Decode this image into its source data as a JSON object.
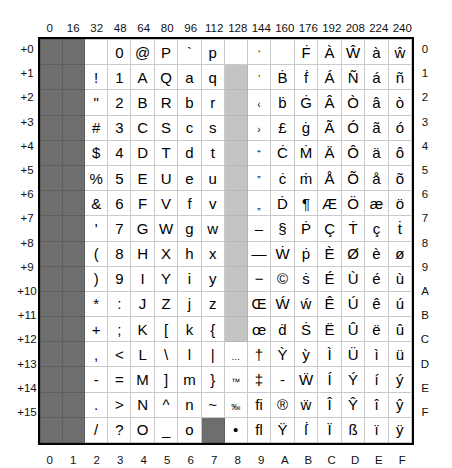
{
  "axes": {
    "column_headers": [
      "0",
      "16",
      "32",
      "48",
      "64",
      "80",
      "96",
      "112",
      "128",
      "144",
      "160",
      "176",
      "192",
      "208",
      "224",
      "240"
    ],
    "row_labels_left": [
      "+0",
      "+1",
      "+2",
      "+3",
      "+4",
      "+5",
      "+6",
      "+7",
      "+8",
      "+9",
      "+10",
      "+11",
      "+12",
      "+13",
      "+14",
      "+15"
    ],
    "row_labels_right": [
      "0",
      "1",
      "2",
      "3",
      "4",
      "5",
      "6",
      "7",
      "8",
      "9",
      "A",
      "B",
      "C",
      "D",
      "E",
      "F"
    ],
    "column_footers": [
      "0",
      "1",
      "2",
      "3",
      "4",
      "5",
      "6",
      "7",
      "8",
      "9",
      "A",
      "B",
      "C",
      "D",
      "E",
      "F"
    ]
  },
  "legend": {
    "control_color": "#6e6e6e",
    "unused_color": "#c4c4c4",
    "cell_color": "#ffffff",
    "grid_line_color": "#c9c9c9",
    "frame_color": "#000000"
  },
  "grid": {
    "rows": [
      [
        {
          "ch": "",
          "state": "control"
        },
        {
          "ch": "",
          "state": "control"
        },
        {
          "ch": "",
          "state": "normal"
        },
        {
          "ch": "0",
          "state": "normal"
        },
        {
          "ch": "@",
          "state": "normal"
        },
        {
          "ch": "P",
          "state": "normal"
        },
        {
          "ch": "`",
          "state": "normal"
        },
        {
          "ch": "p",
          "state": "normal"
        },
        {
          "ch": "",
          "state": "normal"
        },
        {
          "ch": "‘",
          "state": "normal"
        },
        {
          "ch": "",
          "state": "normal"
        },
        {
          "ch": "Ḟ",
          "state": "normal"
        },
        {
          "ch": "À",
          "state": "normal"
        },
        {
          "ch": "Ŵ",
          "state": "normal"
        },
        {
          "ch": "à",
          "state": "normal"
        },
        {
          "ch": "ŵ",
          "state": "normal"
        }
      ],
      [
        {
          "ch": "",
          "state": "control"
        },
        {
          "ch": "",
          "state": "control"
        },
        {
          "ch": "!",
          "state": "normal"
        },
        {
          "ch": "1",
          "state": "normal"
        },
        {
          "ch": "A",
          "state": "normal"
        },
        {
          "ch": "Q",
          "state": "normal"
        },
        {
          "ch": "a",
          "state": "normal"
        },
        {
          "ch": "q",
          "state": "normal"
        },
        {
          "ch": "",
          "state": "unused"
        },
        {
          "ch": "’",
          "state": "normal"
        },
        {
          "ch": "Ḃ",
          "state": "normal"
        },
        {
          "ch": "ḟ",
          "state": "normal"
        },
        {
          "ch": "Á",
          "state": "normal"
        },
        {
          "ch": "Ñ",
          "state": "normal"
        },
        {
          "ch": "á",
          "state": "normal"
        },
        {
          "ch": "ñ",
          "state": "normal"
        }
      ],
      [
        {
          "ch": "",
          "state": "control"
        },
        {
          "ch": "",
          "state": "control"
        },
        {
          "ch": "\"",
          "state": "normal"
        },
        {
          "ch": "2",
          "state": "normal"
        },
        {
          "ch": "B",
          "state": "normal"
        },
        {
          "ch": "R",
          "state": "normal"
        },
        {
          "ch": "b",
          "state": "normal"
        },
        {
          "ch": "r",
          "state": "normal"
        },
        {
          "ch": "",
          "state": "unused"
        },
        {
          "ch": "‹",
          "state": "normal"
        },
        {
          "ch": "ḃ",
          "state": "normal"
        },
        {
          "ch": "Ġ",
          "state": "normal"
        },
        {
          "ch": "Â",
          "state": "normal"
        },
        {
          "ch": "Ò",
          "state": "normal"
        },
        {
          "ch": "â",
          "state": "normal"
        },
        {
          "ch": "ò",
          "state": "normal"
        }
      ],
      [
        {
          "ch": "",
          "state": "control"
        },
        {
          "ch": "",
          "state": "control"
        },
        {
          "ch": "#",
          "state": "normal"
        },
        {
          "ch": "3",
          "state": "normal"
        },
        {
          "ch": "C",
          "state": "normal"
        },
        {
          "ch": "S",
          "state": "normal"
        },
        {
          "ch": "c",
          "state": "normal"
        },
        {
          "ch": "s",
          "state": "normal"
        },
        {
          "ch": "",
          "state": "unused"
        },
        {
          "ch": "›",
          "state": "normal"
        },
        {
          "ch": "£",
          "state": "normal"
        },
        {
          "ch": "ġ",
          "state": "normal"
        },
        {
          "ch": "Ã",
          "state": "normal"
        },
        {
          "ch": "Ó",
          "state": "normal"
        },
        {
          "ch": "ã",
          "state": "normal"
        },
        {
          "ch": "ó",
          "state": "normal"
        }
      ],
      [
        {
          "ch": "",
          "state": "control"
        },
        {
          "ch": "",
          "state": "control"
        },
        {
          "ch": "$",
          "state": "normal"
        },
        {
          "ch": "4",
          "state": "normal"
        },
        {
          "ch": "D",
          "state": "normal"
        },
        {
          "ch": "T",
          "state": "normal"
        },
        {
          "ch": "d",
          "state": "normal"
        },
        {
          "ch": "t",
          "state": "normal"
        },
        {
          "ch": "",
          "state": "unused"
        },
        {
          "ch": "“",
          "state": "normal"
        },
        {
          "ch": "Ċ",
          "state": "normal"
        },
        {
          "ch": "Ṁ",
          "state": "normal"
        },
        {
          "ch": "Ä",
          "state": "normal"
        },
        {
          "ch": "Ô",
          "state": "normal"
        },
        {
          "ch": "ä",
          "state": "normal"
        },
        {
          "ch": "ô",
          "state": "normal"
        }
      ],
      [
        {
          "ch": "",
          "state": "control"
        },
        {
          "ch": "",
          "state": "control"
        },
        {
          "ch": "%",
          "state": "normal"
        },
        {
          "ch": "5",
          "state": "normal"
        },
        {
          "ch": "E",
          "state": "normal"
        },
        {
          "ch": "U",
          "state": "normal"
        },
        {
          "ch": "e",
          "state": "normal"
        },
        {
          "ch": "u",
          "state": "normal"
        },
        {
          "ch": "",
          "state": "unused"
        },
        {
          "ch": "”",
          "state": "normal"
        },
        {
          "ch": "ċ",
          "state": "normal"
        },
        {
          "ch": "ṁ",
          "state": "normal"
        },
        {
          "ch": "Å",
          "state": "normal"
        },
        {
          "ch": "Õ",
          "state": "normal"
        },
        {
          "ch": "å",
          "state": "normal"
        },
        {
          "ch": "õ",
          "state": "normal"
        }
      ],
      [
        {
          "ch": "",
          "state": "control"
        },
        {
          "ch": "",
          "state": "control"
        },
        {
          "ch": "&",
          "state": "normal"
        },
        {
          "ch": "6",
          "state": "normal"
        },
        {
          "ch": "F",
          "state": "normal"
        },
        {
          "ch": "V",
          "state": "normal"
        },
        {
          "ch": "f",
          "state": "normal"
        },
        {
          "ch": "v",
          "state": "normal"
        },
        {
          "ch": "",
          "state": "unused"
        },
        {
          "ch": "„",
          "state": "normal"
        },
        {
          "ch": "Ḋ",
          "state": "normal"
        },
        {
          "ch": "¶",
          "state": "normal"
        },
        {
          "ch": "Æ",
          "state": "normal"
        },
        {
          "ch": "Ö",
          "state": "normal"
        },
        {
          "ch": "æ",
          "state": "normal"
        },
        {
          "ch": "ö",
          "state": "normal"
        }
      ],
      [
        {
          "ch": "",
          "state": "control"
        },
        {
          "ch": "",
          "state": "control"
        },
        {
          "ch": "'",
          "state": "normal"
        },
        {
          "ch": "7",
          "state": "normal"
        },
        {
          "ch": "G",
          "state": "normal"
        },
        {
          "ch": "W",
          "state": "normal"
        },
        {
          "ch": "g",
          "state": "normal"
        },
        {
          "ch": "w",
          "state": "normal"
        },
        {
          "ch": "",
          "state": "unused"
        },
        {
          "ch": "–",
          "state": "normal"
        },
        {
          "ch": "§",
          "state": "normal"
        },
        {
          "ch": "Ṗ",
          "state": "normal"
        },
        {
          "ch": "Ç",
          "state": "normal"
        },
        {
          "ch": "Ṫ",
          "state": "normal"
        },
        {
          "ch": "ç",
          "state": "normal"
        },
        {
          "ch": "ṫ",
          "state": "normal"
        }
      ],
      [
        {
          "ch": "",
          "state": "control"
        },
        {
          "ch": "",
          "state": "control"
        },
        {
          "ch": "(",
          "state": "normal"
        },
        {
          "ch": "8",
          "state": "normal"
        },
        {
          "ch": "H",
          "state": "normal"
        },
        {
          "ch": "X",
          "state": "normal"
        },
        {
          "ch": "h",
          "state": "normal"
        },
        {
          "ch": "x",
          "state": "normal"
        },
        {
          "ch": "",
          "state": "unused"
        },
        {
          "ch": "—",
          "state": "normal"
        },
        {
          "ch": "Ẇ",
          "state": "normal"
        },
        {
          "ch": "ṗ",
          "state": "normal"
        },
        {
          "ch": "È",
          "state": "normal"
        },
        {
          "ch": "Ø",
          "state": "normal"
        },
        {
          "ch": "è",
          "state": "normal"
        },
        {
          "ch": "ø",
          "state": "normal"
        }
      ],
      [
        {
          "ch": "",
          "state": "control"
        },
        {
          "ch": "",
          "state": "control"
        },
        {
          "ch": ")",
          "state": "normal"
        },
        {
          "ch": "9",
          "state": "normal"
        },
        {
          "ch": "I",
          "state": "normal"
        },
        {
          "ch": "Y",
          "state": "normal"
        },
        {
          "ch": "i",
          "state": "normal"
        },
        {
          "ch": "y",
          "state": "normal"
        },
        {
          "ch": "",
          "state": "unused"
        },
        {
          "ch": "−",
          "state": "normal"
        },
        {
          "ch": "©",
          "state": "normal"
        },
        {
          "ch": "ṡ",
          "state": "normal"
        },
        {
          "ch": "É",
          "state": "normal"
        },
        {
          "ch": "Ù",
          "state": "normal"
        },
        {
          "ch": "é",
          "state": "normal"
        },
        {
          "ch": "ù",
          "state": "normal"
        }
      ],
      [
        {
          "ch": "",
          "state": "control"
        },
        {
          "ch": "",
          "state": "control"
        },
        {
          "ch": "*",
          "state": "normal"
        },
        {
          "ch": ":",
          "state": "normal"
        },
        {
          "ch": "J",
          "state": "normal"
        },
        {
          "ch": "Z",
          "state": "normal"
        },
        {
          "ch": "j",
          "state": "normal"
        },
        {
          "ch": "z",
          "state": "normal"
        },
        {
          "ch": "",
          "state": "unused"
        },
        {
          "ch": "Œ",
          "state": "normal"
        },
        {
          "ch": "Ẃ",
          "state": "normal"
        },
        {
          "ch": "ẃ",
          "state": "normal"
        },
        {
          "ch": "Ê",
          "state": "normal"
        },
        {
          "ch": "Ú",
          "state": "normal"
        },
        {
          "ch": "ê",
          "state": "normal"
        },
        {
          "ch": "ú",
          "state": "normal"
        }
      ],
      [
        {
          "ch": "",
          "state": "control"
        },
        {
          "ch": "",
          "state": "control"
        },
        {
          "ch": "+",
          "state": "normal"
        },
        {
          "ch": ";",
          "state": "normal"
        },
        {
          "ch": "K",
          "state": "normal"
        },
        {
          "ch": "[",
          "state": "normal"
        },
        {
          "ch": "k",
          "state": "normal"
        },
        {
          "ch": "{",
          "state": "normal"
        },
        {
          "ch": "",
          "state": "unused"
        },
        {
          "ch": "œ",
          "state": "normal"
        },
        {
          "ch": "ḋ",
          "state": "normal"
        },
        {
          "ch": "Ṡ",
          "state": "normal"
        },
        {
          "ch": "Ë",
          "state": "normal"
        },
        {
          "ch": "Û",
          "state": "normal"
        },
        {
          "ch": "ë",
          "state": "normal"
        },
        {
          "ch": "û",
          "state": "normal"
        }
      ],
      [
        {
          "ch": "",
          "state": "control"
        },
        {
          "ch": "",
          "state": "control"
        },
        {
          "ch": ",",
          "state": "normal"
        },
        {
          "ch": "<",
          "state": "normal"
        },
        {
          "ch": "L",
          "state": "normal"
        },
        {
          "ch": "\\",
          "state": "normal"
        },
        {
          "ch": "l",
          "state": "normal"
        },
        {
          "ch": "|",
          "state": "normal"
        },
        {
          "ch": "…",
          "state": "normal"
        },
        {
          "ch": "†",
          "state": "normal"
        },
        {
          "ch": "Ỳ",
          "state": "normal"
        },
        {
          "ch": "ỳ",
          "state": "normal"
        },
        {
          "ch": "Ì",
          "state": "normal"
        },
        {
          "ch": "Ü",
          "state": "normal"
        },
        {
          "ch": "ì",
          "state": "normal"
        },
        {
          "ch": "ü",
          "state": "normal"
        }
      ],
      [
        {
          "ch": "",
          "state": "control"
        },
        {
          "ch": "",
          "state": "control"
        },
        {
          "ch": "-",
          "state": "normal"
        },
        {
          "ch": "=",
          "state": "normal"
        },
        {
          "ch": "M",
          "state": "normal"
        },
        {
          "ch": "]",
          "state": "normal"
        },
        {
          "ch": "m",
          "state": "normal"
        },
        {
          "ch": "}",
          "state": "normal"
        },
        {
          "ch": "™",
          "state": "normal"
        },
        {
          "ch": "‡",
          "state": "normal"
        },
        {
          "ch": "-",
          "state": "normal"
        },
        {
          "ch": "Ẅ",
          "state": "normal"
        },
        {
          "ch": "Í",
          "state": "normal"
        },
        {
          "ch": "Ý",
          "state": "normal"
        },
        {
          "ch": "í",
          "state": "normal"
        },
        {
          "ch": "ý",
          "state": "normal"
        }
      ],
      [
        {
          "ch": "",
          "state": "control"
        },
        {
          "ch": "",
          "state": "control"
        },
        {
          "ch": ".",
          "state": "normal"
        },
        {
          "ch": ">",
          "state": "normal"
        },
        {
          "ch": "N",
          "state": "normal"
        },
        {
          "ch": "^",
          "state": "normal"
        },
        {
          "ch": "n",
          "state": "normal"
        },
        {
          "ch": "~",
          "state": "normal"
        },
        {
          "ch": "‰",
          "state": "normal"
        },
        {
          "ch": "ﬁ",
          "state": "normal"
        },
        {
          "ch": "®",
          "state": "normal"
        },
        {
          "ch": "ẅ",
          "state": "normal"
        },
        {
          "ch": "Î",
          "state": "normal"
        },
        {
          "ch": "Ŷ",
          "state": "normal"
        },
        {
          "ch": "î",
          "state": "normal"
        },
        {
          "ch": "ŷ",
          "state": "normal"
        }
      ],
      [
        {
          "ch": "",
          "state": "control"
        },
        {
          "ch": "",
          "state": "control"
        },
        {
          "ch": "/",
          "state": "normal"
        },
        {
          "ch": "?",
          "state": "normal"
        },
        {
          "ch": "O",
          "state": "normal"
        },
        {
          "ch": "_",
          "state": "normal"
        },
        {
          "ch": "o",
          "state": "normal"
        },
        {
          "ch": "",
          "state": "del"
        },
        {
          "ch": "•",
          "state": "normal"
        },
        {
          "ch": "ﬂ",
          "state": "normal"
        },
        {
          "ch": "Ÿ",
          "state": "normal"
        },
        {
          "ch": "ẛ",
          "state": "normal"
        },
        {
          "ch": "Ï",
          "state": "normal"
        },
        {
          "ch": "ß",
          "state": "normal"
        },
        {
          "ch": "ï",
          "state": "normal"
        },
        {
          "ch": "ÿ",
          "state": "normal"
        }
      ]
    ]
  }
}
